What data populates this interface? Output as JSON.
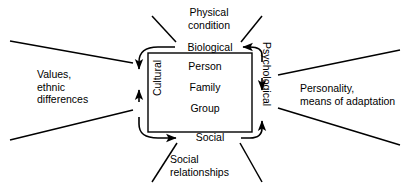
{
  "diagram": {
    "colors": {
      "stroke": "#000000",
      "text": "#000000",
      "background": "#ffffff"
    },
    "core": {
      "items": [
        {
          "label": "Person"
        },
        {
          "label": "Family"
        },
        {
          "label": "Group"
        }
      ]
    },
    "domains": [
      {
        "id": "biological",
        "label": "Biological",
        "position": "top"
      },
      {
        "id": "psychological",
        "label": "Psychological",
        "position": "right"
      },
      {
        "id": "social",
        "label": "Social",
        "position": "bottom"
      },
      {
        "id": "cultural",
        "label": "Cultural",
        "position": "left"
      }
    ],
    "context_labels": [
      {
        "id": "physical-condition",
        "lines": "Physical\ncondition",
        "position": "top"
      },
      {
        "id": "personality",
        "lines": "Personality,\nmeans of adaptation",
        "position": "right"
      },
      {
        "id": "social-relationships",
        "lines": "Social\nrelationships",
        "position": "bottom"
      },
      {
        "id": "values-ethnic-differences",
        "lines": "Values,\nethnic\ndifferences",
        "position": "left"
      }
    ]
  }
}
